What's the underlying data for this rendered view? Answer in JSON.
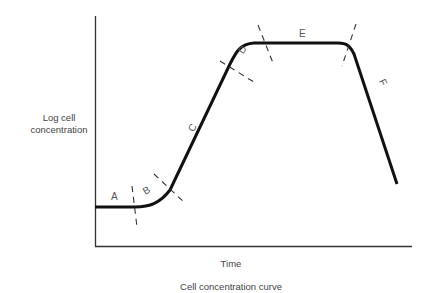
{
  "title": "Cell concentration curve",
  "axes": {
    "ylabel_line1": "Log cell",
    "ylabel_line2": "concentration",
    "xlabel": "Time"
  },
  "phases": [
    {
      "label": "A"
    },
    {
      "label": "B"
    },
    {
      "label": "C"
    },
    {
      "label": "D"
    },
    {
      "label": "E"
    },
    {
      "label": "F"
    }
  ],
  "colors": {
    "curve": "#111111",
    "axis": "#333333",
    "dashes": "#333333",
    "text": "#444444"
  }
}
